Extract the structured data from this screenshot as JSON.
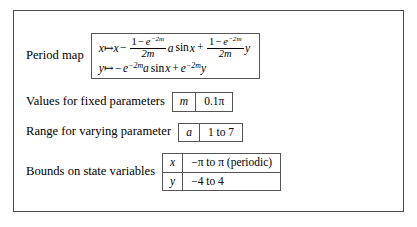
{
  "figure": {
    "rows": [
      {
        "label": "Period map"
      },
      {
        "label": "Values for fixed parameters"
      },
      {
        "label": "Range for varying parameter"
      },
      {
        "label": "Bounds on state variables"
      }
    ]
  },
  "period_map": {
    "line1": {
      "variable": "x",
      "mapsto": "↦",
      "expression": "x − (1 − e^{−2m})/(2m) a sin x + (1 − e^{−2m})/(2m) y",
      "terms": {
        "lead_var": "x",
        "minus": "−",
        "frac1_num_one": "1",
        "frac1_num_minus": "−",
        "frac1_num_e": "e",
        "frac1_num_exp_minus": "−",
        "frac1_num_exp_val": "2m",
        "frac1_den": "2m",
        "coef_a": "a",
        "sin": "sin",
        "sin_arg": "x",
        "plus": "+",
        "frac2_num_one": "1",
        "frac2_num_minus": "−",
        "frac2_num_e": "e",
        "frac2_num_exp_minus": "−",
        "frac2_num_exp_val": "2m",
        "frac2_den": "2m",
        "trail_var": "y"
      }
    },
    "line2": {
      "variable": "y",
      "mapsto": "↦",
      "expression": "−e^{−2m} a sin x + e^{−2m} y",
      "terms": {
        "lead_minus": "−",
        "e1": "e",
        "e1_exp_minus": "−",
        "e1_exp_val": "2m",
        "coef_a": "a",
        "sin": "sin",
        "sin_arg": "x",
        "plus": "+",
        "e2": "e",
        "e2_exp_minus": "−",
        "e2_exp_val": "2m",
        "trail_var": "y"
      }
    }
  },
  "fixed_parameters": {
    "label": "Values for fixed parameters",
    "entries": [
      {
        "symbol": "m",
        "value": "0.1π"
      }
    ]
  },
  "varying_parameter": {
    "label": "Range for varying parameter",
    "entries": [
      {
        "symbol": "a",
        "value": "1 to 7"
      }
    ]
  },
  "state_bounds": {
    "label": "Bounds on state variables",
    "entries": [
      {
        "symbol": "x",
        "value": "−π to π (periodic)"
      },
      {
        "symbol": "y",
        "value": "−4 to 4"
      }
    ]
  },
  "colors": {
    "border": "#555555",
    "frame_border": "#4a4a4a",
    "background": "#ffffff",
    "text": "#000000"
  }
}
